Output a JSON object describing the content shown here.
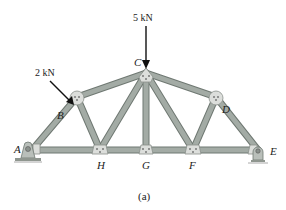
{
  "figure": {
    "caption": "(a)",
    "type": "truss",
    "loads": [
      {
        "label": "5 kN",
        "joint": "C",
        "direction": "down"
      },
      {
        "label": "2 kN",
        "joint": "B",
        "direction": "normal to AC"
      }
    ],
    "joints": [
      {
        "name": "A",
        "x": 32,
        "y": 150
      },
      {
        "name": "B",
        "x": 77,
        "y": 97
      },
      {
        "name": "C",
        "x": 146,
        "y": 73
      },
      {
        "name": "D",
        "x": 216,
        "y": 97
      },
      {
        "name": "E",
        "x": 258,
        "y": 150
      },
      {
        "name": "F",
        "x": 193,
        "y": 150
      },
      {
        "name": "G",
        "x": 146,
        "y": 150
      },
      {
        "name": "H",
        "x": 100,
        "y": 150
      }
    ],
    "members": [
      "AB",
      "BC",
      "CD",
      "DE",
      "AH",
      "HG",
      "GF",
      "FE",
      "BH",
      "HC",
      "CG",
      "CF",
      "FD"
    ],
    "supports": [
      {
        "joint": "A",
        "type": "pin"
      },
      {
        "joint": "E",
        "type": "roller"
      }
    ],
    "colors": {
      "member": "#9aa39c",
      "member_edge": "#6f7872",
      "gusset": "#d9dbd8",
      "arrow": "#111111"
    }
  }
}
